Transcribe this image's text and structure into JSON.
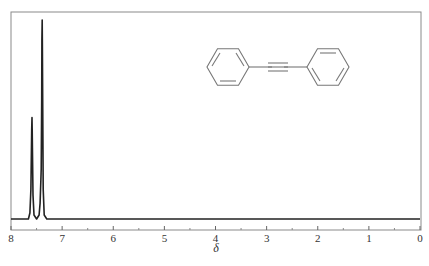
{
  "chart_data": {
    "type": "line",
    "title": "",
    "subtitle": "1H NMR spectrum of diphenylacetylene",
    "xlabel": "δ",
    "ylabel": "",
    "xlim": [
      8,
      0
    ],
    "x_reversed": true,
    "grid": false,
    "legend": null,
    "x_ticks": [
      8,
      7,
      6,
      5,
      4,
      3,
      2,
      1,
      0
    ],
    "x_tick_labels": [
      "8",
      "7",
      "6",
      "5",
      "4",
      "3",
      "2",
      "1",
      "0"
    ],
    "minor_ticks": [
      7.5,
      6.5,
      5.5,
      4.5,
      3.5,
      2.5,
      1.5,
      0.5
    ],
    "peaks": [
      {
        "shift_ppm": 7.59,
        "relative_intensity": 0.51
      },
      {
        "shift_ppm": 7.41,
        "relative_intensity": 0.25
      },
      {
        "shift_ppm": 7.39,
        "relative_intensity": 1.0
      }
    ],
    "series": [
      {
        "name": "spectrum",
        "x": [
          8.0,
          7.66,
          7.63,
          7.61,
          7.595,
          7.59,
          7.585,
          7.57,
          7.55,
          7.5,
          7.45,
          7.43,
          7.415,
          7.41,
          7.4,
          7.395,
          7.39,
          7.385,
          7.37,
          7.35,
          7.3,
          0.0
        ],
        "y": [
          0.0,
          0.0,
          0.03,
          0.15,
          0.45,
          0.51,
          0.45,
          0.12,
          0.02,
          0.0,
          0.02,
          0.08,
          0.2,
          0.25,
          0.6,
          0.9,
          1.0,
          0.85,
          0.15,
          0.02,
          0.0,
          0.0
        ]
      }
    ],
    "annotations": [
      {
        "type": "structure",
        "text": "diphenylacetylene (Ph–C≡C–Ph)"
      }
    ]
  },
  "axis": {
    "title": "δ",
    "ticks": [
      "8",
      "7",
      "6",
      "5",
      "4",
      "3",
      "2",
      "1",
      "0"
    ]
  },
  "colors": {
    "spectrum": "#222222",
    "frame": "#888888",
    "structure": "#777777"
  }
}
